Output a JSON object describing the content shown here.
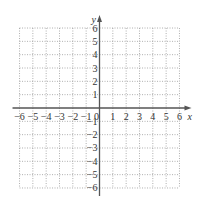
{
  "chart_data": {
    "type": "scatter",
    "title": "",
    "xlabel": "x",
    "ylabel": "y",
    "xlim": [
      -6,
      6
    ],
    "ylim": [
      -6,
      6
    ],
    "grid": true,
    "grid_style": "dotted",
    "x_ticks": [
      -6,
      -5,
      -4,
      -3,
      -2,
      -1,
      0,
      1,
      2,
      3,
      4,
      5,
      6
    ],
    "y_ticks": [
      -6,
      -5,
      -4,
      -3,
      -2,
      -1,
      1,
      2,
      3,
      4,
      5,
      6
    ],
    "x_tick_labels": [
      "−6",
      "−5",
      "−4",
      "−3",
      "−2",
      "−1",
      "0",
      "1",
      "2",
      "3",
      "4",
      "5",
      "6"
    ],
    "y_tick_labels": [
      "−6",
      "−5",
      "−4",
      "−3",
      "−2",
      "−1",
      "1",
      "2",
      "3",
      "4",
      "5",
      "6"
    ],
    "series": [],
    "legend": null
  },
  "colors": {
    "axis": "#555555",
    "grid": "#9a9a9a",
    "text": "#333333"
  },
  "layout": {
    "origin_x": 99.5,
    "origin_y": 108,
    "unit": 13.33
  }
}
